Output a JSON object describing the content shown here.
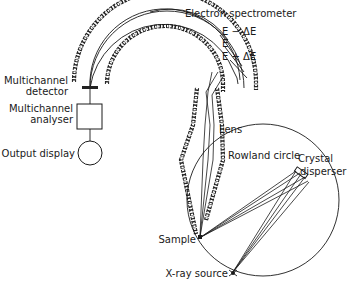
{
  "diagram": {
    "labels": {
      "electron_spectrometer": "Electron spectrometer",
      "e_minus": "E − ΔE",
      "e": "E",
      "e_plus": "E + ΔE",
      "multichannel_detector_l1": "Multichannel",
      "multichannel_detector_l2": "detector",
      "multichannel_analyser_l1": "Multichannel",
      "multichannel_analyser_l2": "analyser",
      "output_display": "Output display",
      "lens": "Lens",
      "rowland_circle": "Rowland circle",
      "crystal_disperser_l1": "Crystal",
      "crystal_disperser_l2": "disperser",
      "sample": "Sample",
      "xray_source": "X-ray source"
    },
    "colors": {
      "ink": "#1a1a1a",
      "background": "#ffffff"
    }
  }
}
